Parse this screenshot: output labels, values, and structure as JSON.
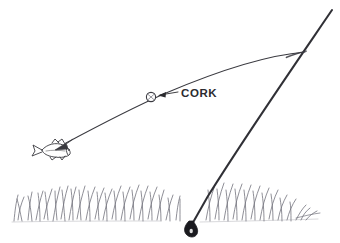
{
  "figure": {
    "name": "fishing-rod-cork-sketch",
    "medium": "pencil-line-drawing",
    "background_color": "#ffffff",
    "ink_color": "#3a3a40",
    "grass_color": "#6e6e78",
    "width": 340,
    "height": 243
  },
  "labels": {
    "cork": "CORK"
  },
  "elements": {
    "rod": {
      "name": "fishing-rod",
      "description": "straight tapered rod from upper right to lower left",
      "tip_point": [
        332,
        10
      ],
      "butt_point": [
        190,
        226
      ]
    },
    "reel_knob": {
      "name": "reel-knob",
      "description": "dark filled teardrop at rod butt",
      "position": [
        192,
        229
      ]
    },
    "line": {
      "name": "fishing-line",
      "description": "curved line from rod tip to fish",
      "start_point": [
        304,
        52
      ],
      "end_point": [
        64,
        144
      ]
    },
    "cork_float": {
      "name": "cork-float",
      "description": "small circle threaded on the fishing line",
      "position": [
        151,
        97
      ],
      "radius": 4.5
    },
    "fish": {
      "name": "fish",
      "description": "small fish sketch facing left at end of line",
      "position": [
        50,
        150
      ]
    },
    "pointer": {
      "name": "label-pointer",
      "description": "leader line with arrowhead from CORK label to cork float",
      "from_point": [
        178,
        92
      ],
      "to_point": [
        159,
        95
      ]
    },
    "grass": {
      "name": "grass-band",
      "description": "band of sketched grass blades along the bottom",
      "top": 183,
      "bottom": 222
    }
  }
}
